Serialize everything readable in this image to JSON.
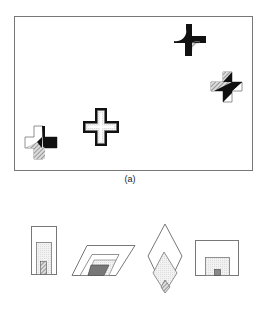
{
  "figure": {
    "caption": "(a)",
    "panel_a": {
      "description": "Rectangular frame containing four cross-shaped markers with varied shading patterns",
      "markers": [
        {
          "id": "cross-top-right",
          "style": "black with curved notch and hatched quadrant"
        },
        {
          "id": "cross-right",
          "style": "diagonal black/hatched split"
        },
        {
          "id": "cross-center",
          "style": "outlined double border"
        },
        {
          "id": "cross-bottom-left",
          "style": "white, black and hatched quadrants"
        }
      ]
    },
    "panel_b": {
      "description": "Four nested shapes with shaded inner regions",
      "shapes": [
        {
          "id": "tall-rectangle"
        },
        {
          "id": "parallelogram"
        },
        {
          "id": "diamond"
        },
        {
          "id": "wide-rectangle"
        }
      ]
    }
  }
}
